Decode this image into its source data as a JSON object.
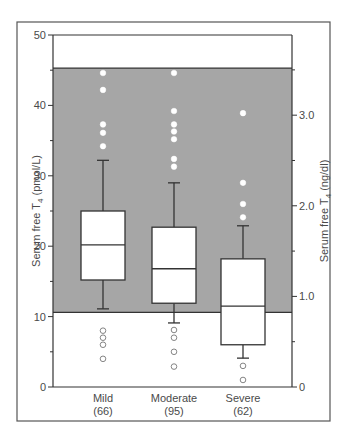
{
  "chart_data": {
    "type": "box",
    "title": "",
    "ylabel": "Serum free T4 (pmol/L)",
    "ylabel_right": "Serum free T4 (ng/dl)",
    "ylim": [
      0,
      50
    ],
    "ylim_right": [
      0,
      4.3
    ],
    "yticks": [
      0,
      10,
      20,
      30,
      40,
      50
    ],
    "yticks_right": [
      0,
      1.0,
      2.0,
      3.0
    ],
    "yticks_right_labels": [
      "0",
      "1.0",
      "2.0",
      "3.0"
    ],
    "reference_range": {
      "low": 10.6,
      "high": 45.3,
      "color": "#a6a6a6"
    },
    "categories": [
      "Mild",
      "Moderate",
      "Severe"
    ],
    "category_n": [
      "(66)",
      "(95)",
      "(62)"
    ],
    "series": [
      {
        "name": "Mild",
        "n": 66,
        "whisker_low": 11.1,
        "q1": 15.2,
        "median": 20.2,
        "q3": 25.0,
        "whisker_high": 32.2,
        "outliers": [
          44.6,
          42.2,
          37.3,
          36.1,
          34.2,
          8.0,
          7.0,
          6.0,
          4.0
        ]
      },
      {
        "name": "Moderate",
        "n": 95,
        "whisker_low": 9.1,
        "q1": 11.9,
        "median": 16.8,
        "q3": 22.7,
        "whisker_high": 29.0,
        "outliers": [
          44.6,
          39.2,
          37.3,
          36.3,
          35.2,
          32.4,
          31.3,
          8.1,
          7.0,
          5.0,
          2.9
        ]
      },
      {
        "name": "Severe",
        "n": 62,
        "whisker_low": 4.1,
        "q1": 6.0,
        "median": 11.5,
        "q3": 18.2,
        "whisker_high": 22.9,
        "outliers": [
          38.9,
          29.0,
          26.0,
          24.1,
          3.0,
          1.0
        ]
      }
    ],
    "grid": false,
    "legend": "none"
  },
  "labels": {
    "ylabel_main": "Serum free T",
    "ylabel_sub": "4",
    "ylabel_unit": " (pmol/L)",
    "ylabel_right_main": "Serum free T",
    "ylabel_right_sub": "4",
    "ylabel_right_unit": " (ng/dl)"
  }
}
